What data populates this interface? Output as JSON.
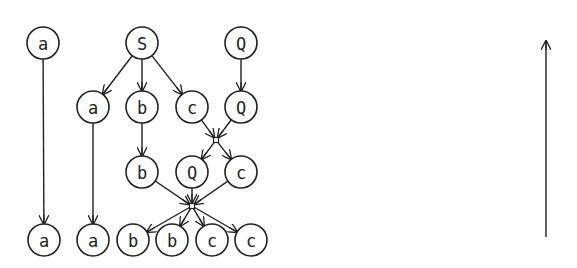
{
  "diagram": {
    "stroke_color": "#222222",
    "background": "#ffffff",
    "node_radius": 16,
    "nodes": [
      {
        "id": "n_a_top",
        "label": "a",
        "x": 43,
        "y": 43
      },
      {
        "id": "n_S",
        "label": "S",
        "x": 142,
        "y": 43
      },
      {
        "id": "n_Q_top",
        "label": "Q",
        "x": 241,
        "y": 43
      },
      {
        "id": "n_a_r2",
        "label": "a",
        "x": 93,
        "y": 107
      },
      {
        "id": "n_b_r2",
        "label": "b",
        "x": 142,
        "y": 107
      },
      {
        "id": "n_c_r2",
        "label": "c",
        "x": 192,
        "y": 107
      },
      {
        "id": "n_Q_r2",
        "label": "Q",
        "x": 241,
        "y": 107
      },
      {
        "id": "n_b_r3",
        "label": "b",
        "x": 142,
        "y": 172
      },
      {
        "id": "n_Q_r3",
        "label": "Q",
        "x": 192,
        "y": 172
      },
      {
        "id": "n_c_r3",
        "label": "c",
        "x": 241,
        "y": 172
      },
      {
        "id": "n_a_b1",
        "label": "a",
        "x": 44,
        "y": 240
      },
      {
        "id": "n_a_b2",
        "label": "a",
        "x": 93,
        "y": 240
      },
      {
        "id": "n_b_b1",
        "label": "b",
        "x": 133,
        "y": 240
      },
      {
        "id": "n_b_b2",
        "label": "b",
        "x": 172,
        "y": 240
      },
      {
        "id": "n_c_b1",
        "label": "c",
        "x": 212,
        "y": 240
      },
      {
        "id": "n_c_b2",
        "label": "c",
        "x": 251,
        "y": 240
      }
    ],
    "junctions": [
      {
        "id": "j1",
        "x": 216,
        "y": 140
      },
      {
        "id": "j2",
        "x": 192,
        "y": 206
      }
    ],
    "edges": [
      {
        "from": "n_a_top",
        "to": "n_a_b1"
      },
      {
        "from": "n_S",
        "to": "n_a_r2"
      },
      {
        "from": "n_S",
        "to": "n_b_r2"
      },
      {
        "from": "n_S",
        "to": "n_c_r2"
      },
      {
        "from": "n_Q_top",
        "to": "n_Q_r2"
      },
      {
        "from": "n_a_r2",
        "to": "n_a_b2"
      },
      {
        "from": "n_b_r2",
        "to": "n_b_r3"
      },
      {
        "from": "n_c_r2",
        "to": "j1"
      },
      {
        "from": "n_Q_r2",
        "to": "j1"
      },
      {
        "from": "j1",
        "to": "n_Q_r3"
      },
      {
        "from": "j1",
        "to": "n_c_r3"
      },
      {
        "from": "n_b_r3",
        "to": "j2"
      },
      {
        "from": "n_Q_r3",
        "to": "j2"
      },
      {
        "from": "n_c_r3",
        "to": "j2"
      },
      {
        "from": "j2",
        "to": "n_b_b1"
      },
      {
        "from": "j2",
        "to": "n_b_b2"
      },
      {
        "from": "j2",
        "to": "n_c_b1"
      },
      {
        "from": "j2",
        "to": "n_c_b2"
      }
    ],
    "side_arrow": {
      "x": 546,
      "y_start": 237,
      "y_end": 41,
      "direction": "up"
    }
  }
}
